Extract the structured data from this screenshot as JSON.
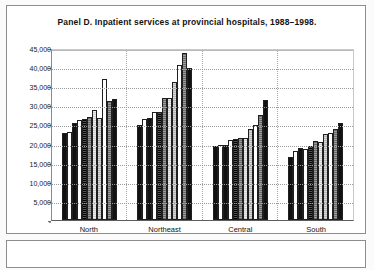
{
  "panel": {
    "title": "Panel D.  Inpatient services at provincial hospitals, 1988–1998."
  },
  "legend": {
    "items": [
      {
        "label": "88",
        "fill": "f-black"
      },
      {
        "label": "89",
        "fill": "f-white"
      },
      {
        "label": "90",
        "fill": "f-black"
      },
      {
        "label": "91",
        "fill": "f-white"
      },
      {
        "label": "92",
        "fill": "f-dark"
      },
      {
        "label": "93",
        "fill": "f-midgray"
      },
      {
        "label": "94",
        "fill": "f-palegray"
      },
      {
        "label": "95",
        "fill": "f-lightgray"
      },
      {
        "label": "96",
        "fill": "f-white"
      },
      {
        "label": "97",
        "fill": "f-midgray"
      },
      {
        "label": "98",
        "fill": "f-black"
      }
    ]
  },
  "axis": {
    "yticks": [
      "45,000",
      "40,000",
      "35,000",
      "30,000",
      "25,000",
      "20,000",
      "15,000",
      "10,000",
      "5,000",
      "-"
    ]
  },
  "chart_data": {
    "type": "bar",
    "title": "Panel D.  Inpatient services at provincial hospitals, 1988–1998.",
    "xlabel": "",
    "ylabel": "",
    "ylim": [
      0,
      45000
    ],
    "ytick_step": 5000,
    "grid": true,
    "legend_position": "bottom",
    "categories": [
      "North",
      "Northeast",
      "Central",
      "South"
    ],
    "series": [
      {
        "name": "88",
        "values": [
          23000,
          25000,
          19600,
          16600
        ]
      },
      {
        "name": "89",
        "values": [
          23200,
          26600,
          19700,
          18100
        ]
      },
      {
        "name": "90",
        "values": [
          25600,
          26800,
          19700,
          19000
        ]
      },
      {
        "name": "91",
        "values": [
          26300,
          28300,
          21000,
          18700
        ]
      },
      {
        "name": "92",
        "values": [
          26600,
          28400,
          21400,
          19600
        ]
      },
      {
        "name": "93",
        "values": [
          27000,
          32000,
          21600,
          20700
        ]
      },
      {
        "name": "94",
        "values": [
          28900,
          32200,
          21700,
          20400
        ]
      },
      {
        "name": "95",
        "values": [
          26900,
          36200,
          24000,
          22700
        ]
      },
      {
        "name": "96",
        "values": [
          37100,
          40900,
          25000,
          22800
        ]
      },
      {
        "name": "97",
        "values": [
          31300,
          43900,
          27600,
          24000
        ]
      },
      {
        "name": "98",
        "values": [
          31800,
          39900,
          31500,
          25600
        ]
      }
    ]
  }
}
